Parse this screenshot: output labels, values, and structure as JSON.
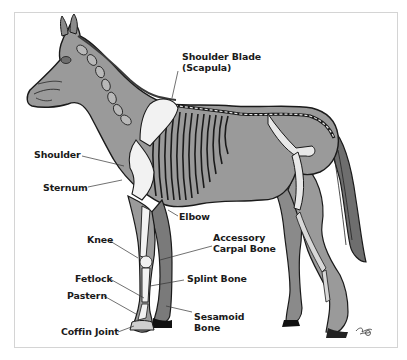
{
  "diagram": {
    "colors": {
      "body": "#9a9a9a",
      "outline": "#1a1a1a",
      "bone": "#f2f2f2",
      "frame": "#d4d4d4",
      "leader": "#333333"
    },
    "labels": {
      "shoulder_blade_line1": "Shoulder Blade",
      "shoulder_blade_line2": "(Scapula)",
      "shoulder": "Shoulder",
      "sternum": "Sternum",
      "elbow": "Elbow",
      "knee": "Knee",
      "accessory_carpal_line1": "Accessory",
      "accessory_carpal_line2": "Carpal Bone",
      "fetlock": "Fetlock",
      "splint_bone": "Splint Bone",
      "pastern": "Pastern",
      "sesamoid_line1": "Sesamoid",
      "sesamoid_line2": "Bone",
      "coffin_joint": "Coffin Joint"
    },
    "signature_icon": "artist-signature"
  }
}
